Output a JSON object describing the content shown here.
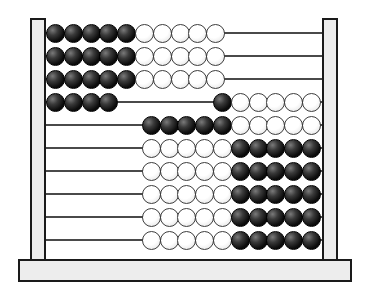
{
  "figure": {
    "name": "abacus-100-bead"
  },
  "colors": {
    "background": "#ffffff",
    "frame_fill": "#ededed",
    "frame_border": "#1a1a1a",
    "rod": "#4a4a4a",
    "black_bead": "#000000",
    "white_bead": "#ffffff",
    "bead_outline": "#3d3d3d"
  },
  "rows": [
    {
      "index": 1,
      "left": [
        "black",
        "black",
        "black",
        "black",
        "black",
        "white",
        "white",
        "white",
        "white",
        "white"
      ],
      "right": []
    },
    {
      "index": 2,
      "left": [
        "black",
        "black",
        "black",
        "black",
        "black",
        "white",
        "white",
        "white",
        "white",
        "white"
      ],
      "right": []
    },
    {
      "index": 3,
      "left": [
        "black",
        "black",
        "black",
        "black",
        "black",
        "white",
        "white",
        "white",
        "white",
        "white"
      ],
      "right": []
    },
    {
      "index": 4,
      "left": [
        "black",
        "black",
        "black",
        "black"
      ],
      "right": [
        "black",
        "white",
        "white",
        "white",
        "white",
        "white"
      ]
    },
    {
      "index": 5,
      "left": [],
      "right": [
        "black",
        "black",
        "black",
        "black",
        "black",
        "white",
        "white",
        "white",
        "white",
        "white"
      ]
    },
    {
      "index": 6,
      "left": [],
      "right": [
        "white",
        "white",
        "white",
        "white",
        "white",
        "black",
        "black",
        "black",
        "black",
        "black"
      ]
    },
    {
      "index": 7,
      "left": [],
      "right": [
        "white",
        "white",
        "white",
        "white",
        "white",
        "black",
        "black",
        "black",
        "black",
        "black"
      ]
    },
    {
      "index": 8,
      "left": [],
      "right": [
        "white",
        "white",
        "white",
        "white",
        "white",
        "black",
        "black",
        "black",
        "black",
        "black"
      ]
    },
    {
      "index": 9,
      "left": [],
      "right": [
        "white",
        "white",
        "white",
        "white",
        "white",
        "black",
        "black",
        "black",
        "black",
        "black"
      ]
    },
    {
      "index": 10,
      "left": [],
      "right": [
        "white",
        "white",
        "white",
        "white",
        "white",
        "black",
        "black",
        "black",
        "black",
        "black"
      ]
    }
  ]
}
